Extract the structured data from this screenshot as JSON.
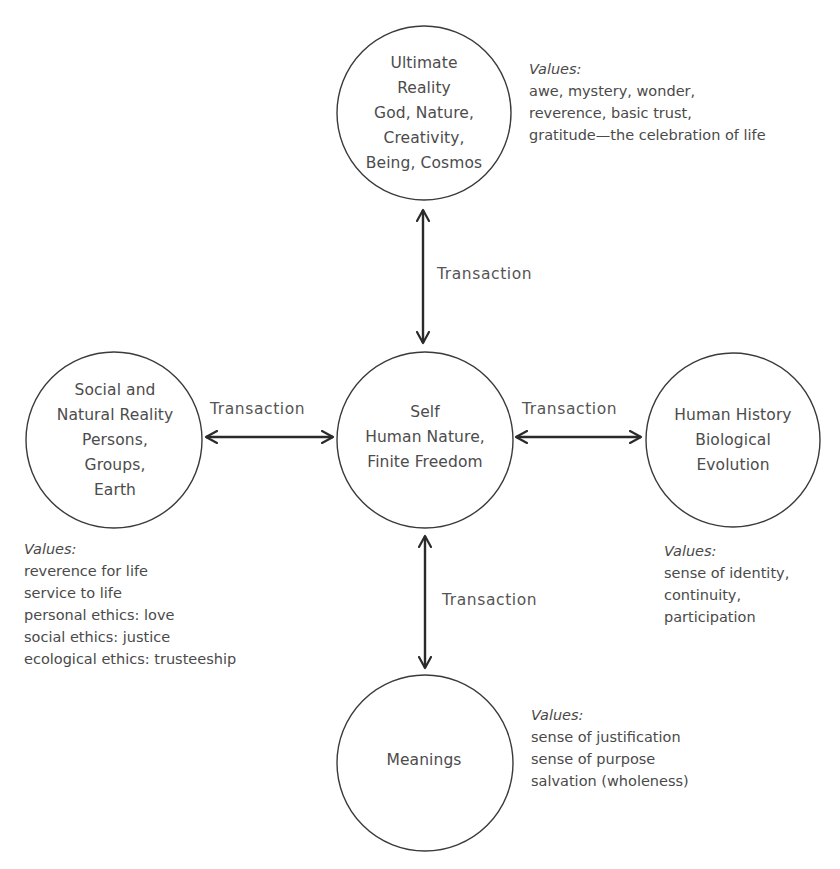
{
  "diagram": {
    "nodes": {
      "ultimate_reality": {
        "lines": [
          "Ultimate",
          "Reality",
          "God, Nature,",
          "Creativity,",
          "Being, Cosmos"
        ],
        "values_title": "Values:",
        "values": [
          "awe, mystery, wonder,",
          "reverence, basic trust,",
          "gratitude—the celebration of life"
        ]
      },
      "social_natural_reality": {
        "lines": [
          "Social and",
          "Natural Reality",
          "Persons,",
          "Groups,",
          "Earth"
        ],
        "values_title": "Values:",
        "values": [
          "reverence for life",
          "service to life",
          "personal ethics: love",
          "social ethics: justice",
          "ecological ethics: trusteeship"
        ]
      },
      "self": {
        "lines": [
          "Self",
          "Human Nature,",
          "Finite Freedom"
        ]
      },
      "human_history": {
        "lines": [
          "Human History",
          "Biological",
          "Evolution"
        ],
        "values_title": "Values:",
        "values": [
          "sense of identity,",
          "continuity,",
          "participation"
        ]
      },
      "meanings": {
        "lines": [
          "Meanings"
        ],
        "values_title": "Values:",
        "values": [
          "sense of justification",
          "sense of purpose",
          "salvation (wholeness)"
        ]
      }
    },
    "edges": {
      "top": {
        "label": "Transaction",
        "from": "self",
        "to": "ultimate_reality",
        "type": "bidirectional"
      },
      "left": {
        "label": "Transaction",
        "from": "self",
        "to": "social_natural_reality",
        "type": "bidirectional"
      },
      "right": {
        "label": "Transaction",
        "from": "self",
        "to": "human_history",
        "type": "bidirectional"
      },
      "bottom": {
        "label": "Transaction",
        "from": "self",
        "to": "meanings",
        "type": "bidirectional"
      }
    },
    "colors": {
      "stroke": "#333333",
      "text": "#4a4a4a",
      "background": "#ffffff"
    }
  }
}
